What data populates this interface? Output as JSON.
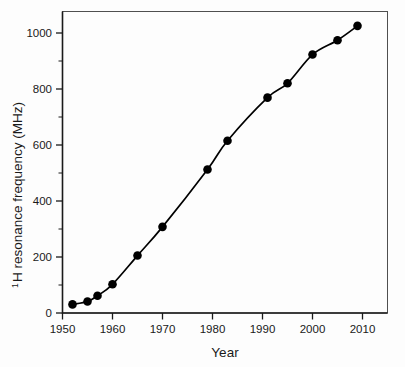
{
  "figure": {
    "background_color": "#fdfdfd",
    "frame_color": "#4f4f4f",
    "axis_color": "#1a1a1a"
  },
  "chart_data": {
    "type": "line",
    "title": "",
    "subtitle": "",
    "xlabel": "Year",
    "ylabel": "H resonance frequency (MHz)",
    "ylabel_superscript": "1",
    "ylabel_full": "¹H resonance frequency (MHz)",
    "xlim": [
      1950,
      2015
    ],
    "ylim": [
      0,
      1050
    ],
    "grid": false,
    "legend": false,
    "legend_position": "none",
    "marker": "filled-circle",
    "marker_color": "#000000",
    "line_color": "#000000",
    "xticks": [
      1950,
      1960,
      1970,
      1980,
      1990,
      2000,
      2010
    ],
    "xtick_labels": [
      "1950",
      "1960",
      "1970",
      "1980",
      "1990",
      "2000",
      "2010"
    ],
    "yticks": [
      0,
      200,
      400,
      600,
      800,
      1000
    ],
    "ytick_labels": [
      "0",
      "200",
      "400",
      "600",
      "800",
      "1000"
    ],
    "yticks_minor": [
      100,
      300,
      500,
      700,
      900
    ],
    "x": [
      1952,
      1955,
      1957,
      1960,
      1965,
      1970,
      1979,
      1983,
      1991,
      1995,
      2000,
      2005,
      2009
    ],
    "values": [
      30,
      40,
      60,
      100,
      200,
      300,
      500,
      600,
      750,
      800,
      900,
      950,
      1000
    ],
    "points": [
      {
        "x": 1952,
        "y": 30
      },
      {
        "x": 1955,
        "y": 40
      },
      {
        "x": 1957,
        "y": 60
      },
      {
        "x": 1960,
        "y": 100
      },
      {
        "x": 1965,
        "y": 200
      },
      {
        "x": 1970,
        "y": 300
      },
      {
        "x": 1979,
        "y": 500
      },
      {
        "x": 1983,
        "y": 600
      },
      {
        "x": 1991,
        "y": 750
      },
      {
        "x": 1995,
        "y": 800
      },
      {
        "x": 2000,
        "y": 900
      },
      {
        "x": 2005,
        "y": 950
      },
      {
        "x": 2009,
        "y": 1000
      }
    ],
    "annotations": []
  }
}
